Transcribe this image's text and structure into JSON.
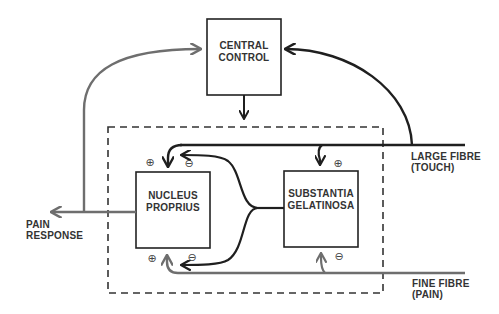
{
  "colors": {
    "dark_line": "#1f1f1f",
    "grey_line": "#6e6e6e",
    "text": "#333333",
    "background": "#ffffff"
  },
  "nodes": {
    "central_control": {
      "line1": "CENTRAL",
      "line2": "CONTROL"
    },
    "nucleus_proprius": {
      "line1": "NUCLEUS",
      "line2": "PROPRIUS"
    },
    "substantia_gelatinosa": {
      "line1": "SUBSTANTIA",
      "line2": "GELATINOSA"
    }
  },
  "labels": {
    "large_fibre": {
      "line1": "LARGE FIBRE",
      "line2": "(TOUCH)"
    },
    "fine_fibre": {
      "line1": "FINE FIBRE",
      "line2": "(PAIN)"
    },
    "pain_response": {
      "line1": "PAIN",
      "line2": "RESPONSE"
    }
  },
  "signs": {
    "np_top_plus": "⊕",
    "np_top_minus": "⊖",
    "np_bottom_plus": "⊕",
    "np_bottom_minus": "⊖",
    "sg_top_plus": "⊕",
    "sg_bottom_minus": "⊖"
  },
  "edges": [
    {
      "from": "large_fibre",
      "to": "central_control",
      "color": "dark"
    },
    {
      "from": "central_control",
      "to": "gate",
      "color": "dark"
    },
    {
      "from": "large_fibre",
      "to": "nucleus_proprius",
      "sign": "+",
      "color": "dark"
    },
    {
      "from": "large_fibre",
      "to": "substantia_gelatinosa",
      "sign": "+",
      "color": "dark"
    },
    {
      "from": "substantia_gelatinosa",
      "to": "nucleus_proprius",
      "sign": "-",
      "position": "top",
      "color": "dark"
    },
    {
      "from": "substantia_gelatinosa",
      "to": "nucleus_proprius",
      "sign": "-",
      "position": "bottom",
      "color": "dark"
    },
    {
      "from": "fine_fibre",
      "to": "nucleus_proprius",
      "sign": "+",
      "color": "grey"
    },
    {
      "from": "fine_fibre",
      "to": "substantia_gelatinosa",
      "sign": "-",
      "color": "grey"
    },
    {
      "from": "nucleus_proprius",
      "to": "pain_response",
      "color": "grey"
    },
    {
      "from": "nucleus_proprius",
      "to": "central_control",
      "color": "grey"
    }
  ]
}
